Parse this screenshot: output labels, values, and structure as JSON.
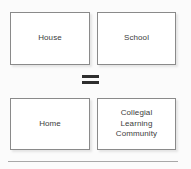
{
  "diagram": {
    "type": "equation-diagram",
    "background_color": "#fbfbfb",
    "box_border_color": "#8a8a8a",
    "box_fill_color": "#ffffff",
    "text_color": "#3c3c3c",
    "operator_color": "#2e2e2e",
    "divider_color": "#a8a8a8",
    "rows": [
      {
        "row_name": "literal-row",
        "boxes": [
          {
            "id": "house",
            "label": "House"
          },
          {
            "id": "school",
            "label": "School"
          }
        ]
      },
      {
        "row_name": "metaphor-row",
        "boxes": [
          {
            "id": "home",
            "label": "Home"
          },
          {
            "id": "collegial-learning-community",
            "label": "Collegial\nLearning\nCommunity"
          }
        ]
      }
    ],
    "operator": {
      "name": "equals-sign",
      "symbol": "="
    },
    "divider": {
      "name": "horizontal-rule"
    }
  }
}
